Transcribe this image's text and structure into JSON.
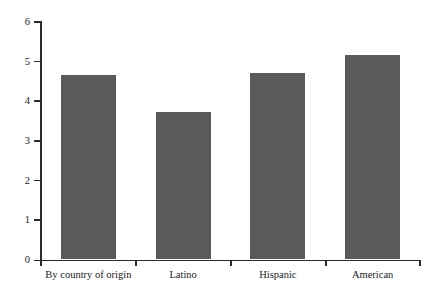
{
  "chart_data": {
    "type": "bar",
    "title": "",
    "subtitle": "",
    "xlabel": "",
    "ylabel": "",
    "categories": [
      "By country of origin",
      "Latino",
      "Hispanic",
      "American"
    ],
    "values": [
      4.65,
      3.72,
      4.68,
      5.15
    ],
    "series": [
      {
        "name": "",
        "values": [
          4.65,
          3.72,
          4.68,
          5.15
        ]
      }
    ],
    "ylim": [
      0,
      6
    ],
    "xlim": [
      0,
      4
    ],
    "y_ticks": [
      0,
      1,
      2,
      3,
      4,
      5,
      6
    ],
    "y_tick_labels": [
      "0",
      "1",
      "2",
      "3",
      "4",
      "5",
      "6"
    ],
    "grid": false,
    "legend": false,
    "legend_position": "none",
    "annotations": [],
    "bar_color": "#5a5a5a",
    "axis_color": "#2b2b2b",
    "background_color": "#ffffff"
  }
}
